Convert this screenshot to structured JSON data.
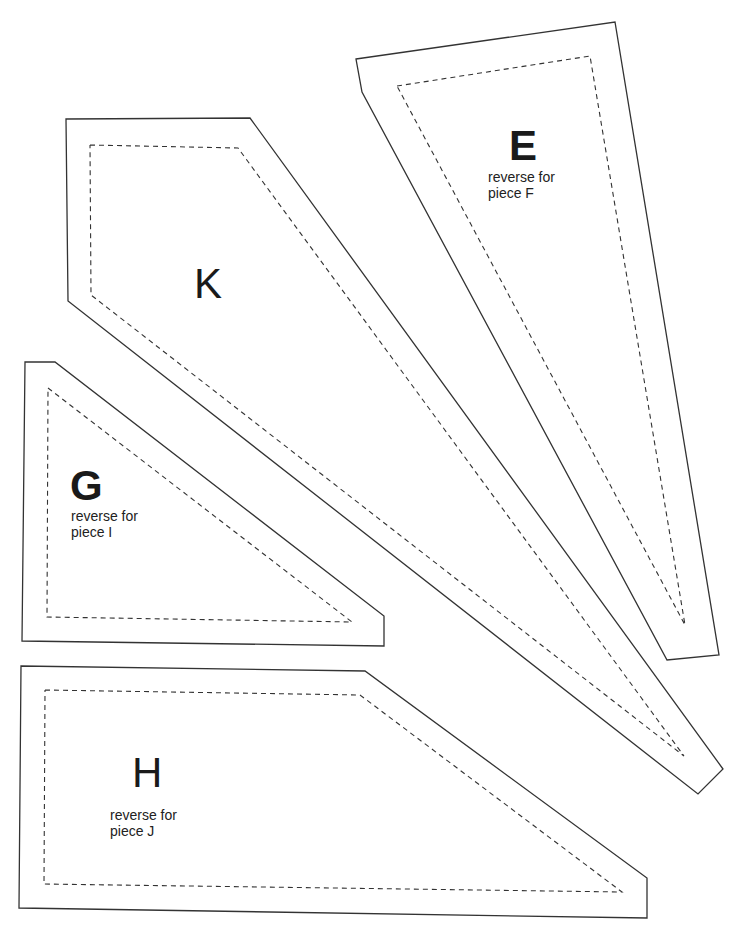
{
  "pieces": {
    "E": {
      "letter": "E",
      "note_line1": "reverse for",
      "note_line2": "piece F"
    },
    "K": {
      "letter": "K"
    },
    "G": {
      "letter": "G",
      "note_line1": "reverse for",
      "note_line2": "piece I"
    },
    "H": {
      "letter": "H",
      "note_line1": "reverse for",
      "note_line2": "piece J"
    }
  },
  "colors": {
    "line": "#333333",
    "background": "#ffffff"
  }
}
